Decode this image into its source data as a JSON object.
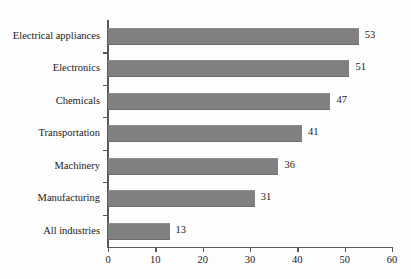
{
  "chart_data": {
    "type": "bar",
    "orientation": "horizontal",
    "title": "",
    "subtitle": "",
    "xlabel": "",
    "ylabel": "",
    "xlim": [
      0,
      60
    ],
    "xticks": [
      0,
      10,
      20,
      30,
      40,
      50,
      60
    ],
    "grid": false,
    "legend": null,
    "bar_color": "#808080",
    "axis_color": "#59595b",
    "background_color": "#fdfdfd",
    "show_value_labels": true,
    "categories": [
      "Electrical appliances",
      "Electronics",
      "Chemicals",
      "Transportation",
      "Machinery",
      "Manufacturing",
      "All industries"
    ],
    "values": [
      53,
      51,
      47,
      41,
      36,
      31,
      13
    ],
    "value_labels": [
      "53",
      "51",
      "47",
      "41",
      "36",
      "31",
      "13"
    ],
    "tick_labels": [
      "0",
      "10",
      "20",
      "30",
      "40",
      "50",
      "60"
    ]
  }
}
